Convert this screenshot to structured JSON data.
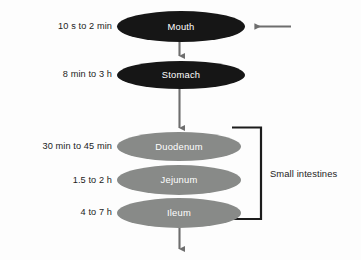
{
  "diagram": {
    "background_color": "#fdfdfd",
    "dark_fill": "#161616",
    "gray_fill": "#888a88",
    "arrow_color": "#6e6e6e",
    "bracket_color": "#1c1c1c",
    "text_color": "#1c1c1c",
    "organ_text_color": "#ffffff"
  },
  "nodes": [
    {
      "id": "mouth",
      "label": "Mouth",
      "time": "10 s to 2 min",
      "fill": "dark"
    },
    {
      "id": "stomach",
      "label": "Stomach",
      "time": "8 min to 3 h",
      "fill": "dark"
    },
    {
      "id": "duodenum",
      "label": "Duodenum",
      "time": "30 min to 45 min",
      "fill": "gray"
    },
    {
      "id": "jejunum",
      "label": "Jejunum",
      "time": "1.5 to 2 h",
      "fill": "gray"
    },
    {
      "id": "ileum",
      "label": "Ileum",
      "time": "4 to 7 h",
      "fill": "gray"
    }
  ],
  "grouping": {
    "bracket_label": "Small intestines",
    "members": [
      "duodenum",
      "jejunum",
      "ileum"
    ]
  },
  "arrows": {
    "input_arrow": "arrow pointing left into Mouth",
    "mouth_to_stomach": "arrow pointing down",
    "stomach_to_duodenum": "arrow pointing down",
    "outlet_arrow": "arrow pointing down out of Ileum"
  }
}
